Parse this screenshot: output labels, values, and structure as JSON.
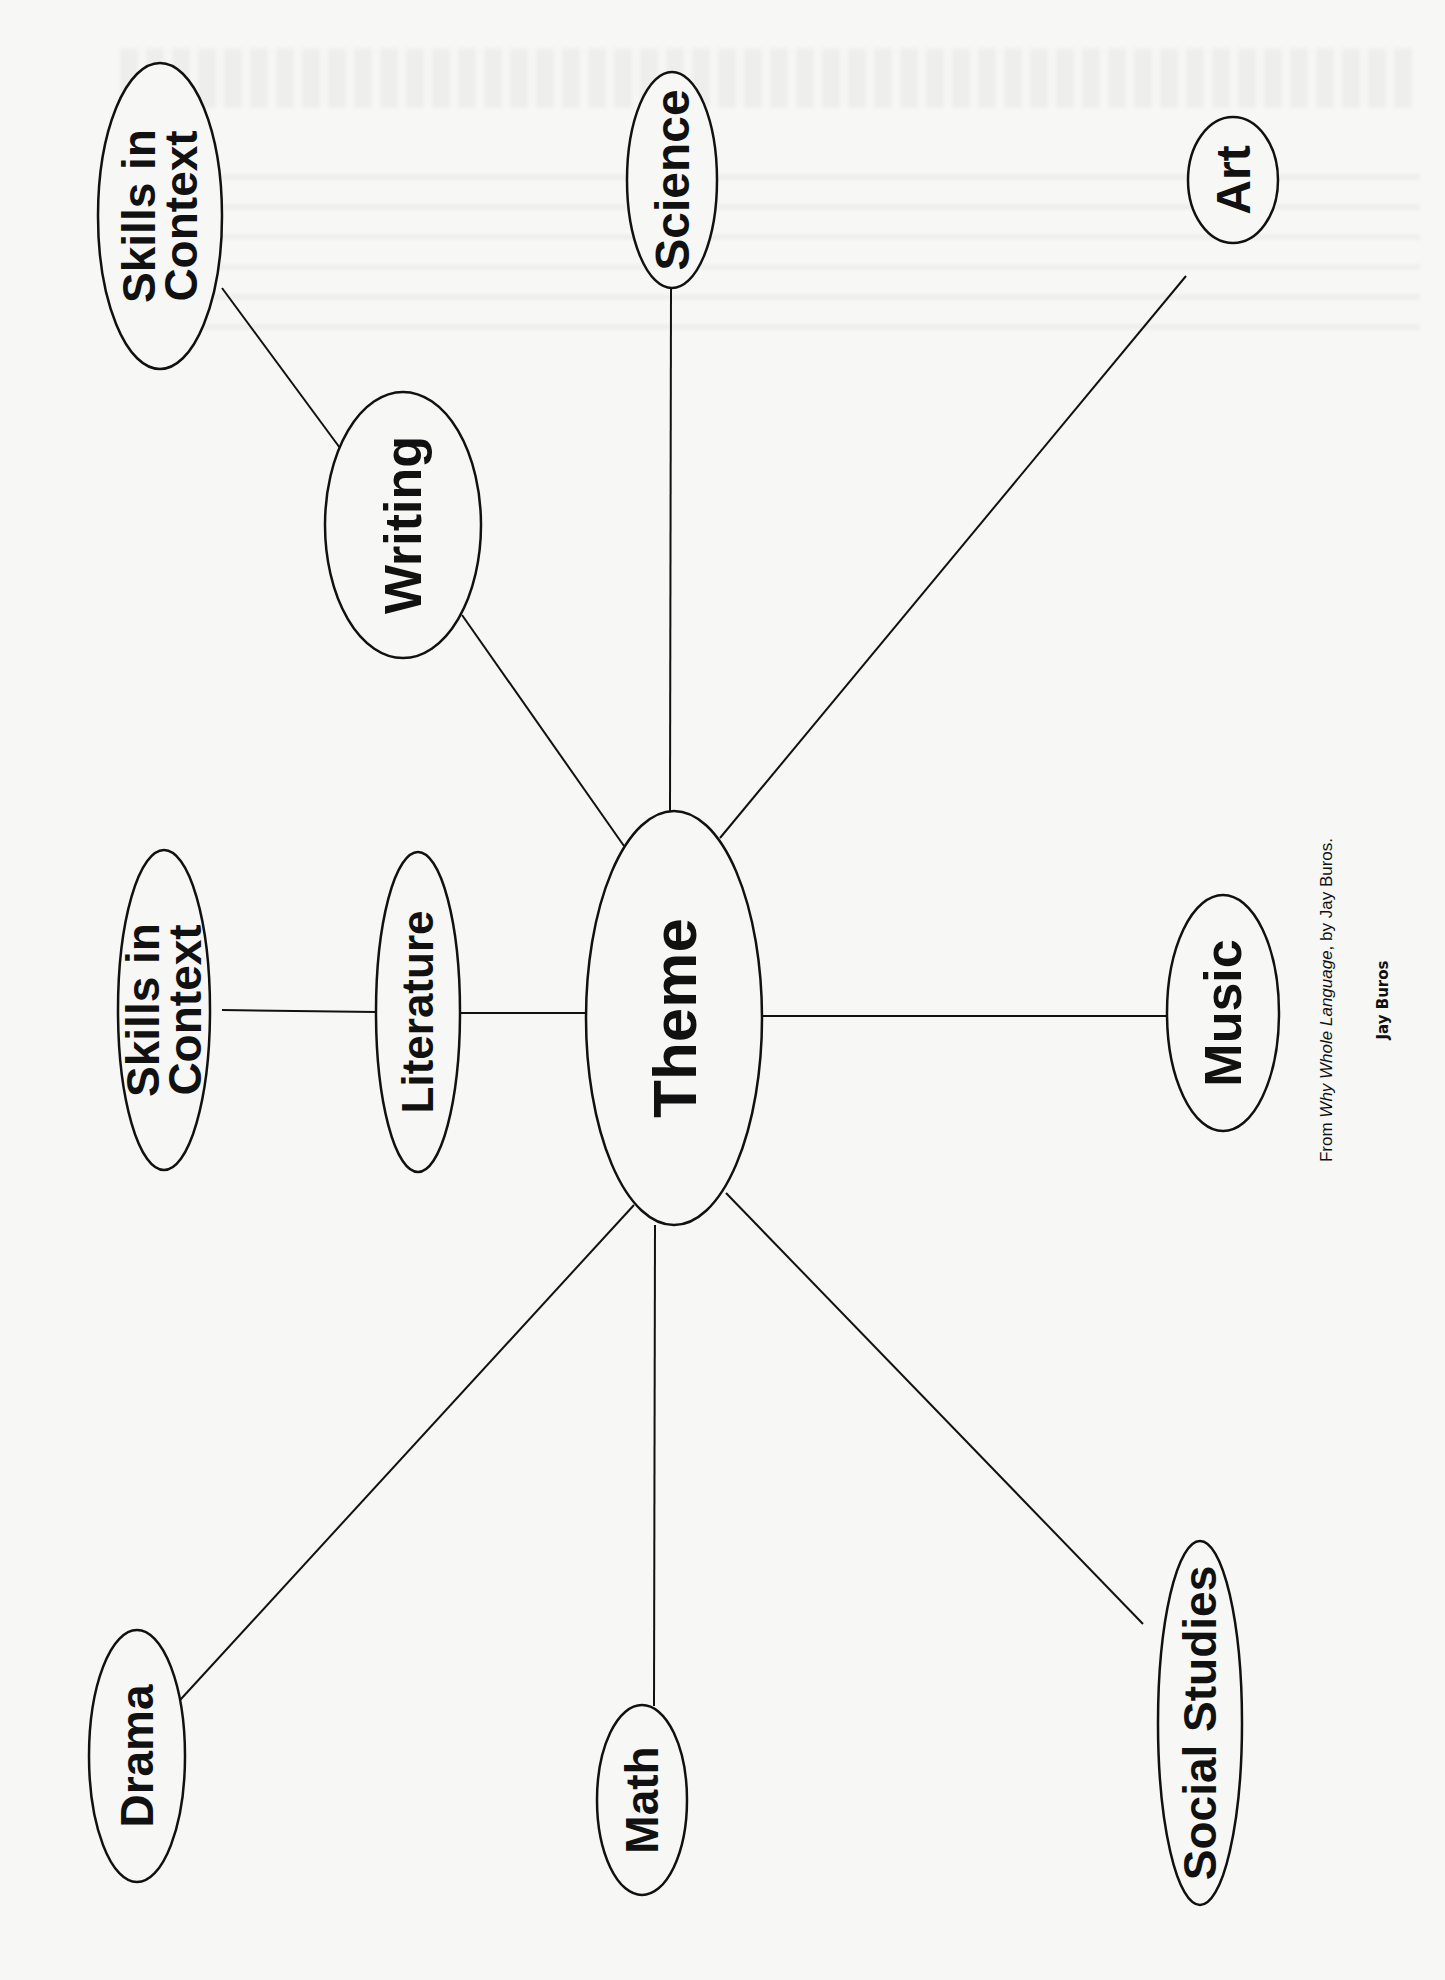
{
  "diagram": {
    "type": "theme web (rotated 90° counter-clockwise)",
    "center": {
      "id": "theme",
      "label": "Theme"
    },
    "nodes": [
      {
        "id": "theme",
        "label": "Theme",
        "lines": [
          "Theme"
        ],
        "cx": 674,
        "cy": 1018,
        "rx": 88,
        "ry": 207,
        "font": 62
      },
      {
        "id": "literature",
        "label": "Literature",
        "lines": [
          "Literature"
        ],
        "cx": 418,
        "cy": 1012,
        "rx": 42,
        "ry": 160,
        "font": 44
      },
      {
        "id": "skills-left",
        "label": "Skills in Context",
        "lines": [
          "Skills in",
          "Context"
        ],
        "cx": 164,
        "cy": 1010,
        "rx": 46,
        "ry": 160,
        "font": 46
      },
      {
        "id": "writing",
        "label": "Writing",
        "lines": [
          "Writing"
        ],
        "cx": 403,
        "cy": 525,
        "rx": 78,
        "ry": 133,
        "font": 52
      },
      {
        "id": "skills-top",
        "label": "Skills in Context",
        "lines": [
          "Skills in",
          "Context"
        ],
        "cx": 160,
        "cy": 216,
        "rx": 62,
        "ry": 153,
        "font": 46
      },
      {
        "id": "science",
        "label": "Science",
        "lines": [
          "Science"
        ],
        "cx": 672,
        "cy": 180,
        "rx": 45,
        "ry": 108,
        "font": 48
      },
      {
        "id": "art",
        "label": "Art",
        "lines": [
          "Art"
        ],
        "cx": 1233,
        "cy": 180,
        "rx": 45,
        "ry": 63,
        "font": 48
      },
      {
        "id": "music",
        "label": "Music",
        "lines": [
          "Music"
        ],
        "cx": 1223,
        "cy": 1013,
        "rx": 56,
        "ry": 118,
        "font": 52
      },
      {
        "id": "social-studies",
        "label": "Social Studies",
        "lines": [
          "Social Studies"
        ],
        "cx": 1200,
        "cy": 1723,
        "rx": 42,
        "ry": 182,
        "font": 46
      },
      {
        "id": "math",
        "label": "Math",
        "lines": [
          "Math"
        ],
        "cx": 642,
        "cy": 1800,
        "rx": 45,
        "ry": 95,
        "font": 46
      },
      {
        "id": "drama",
        "label": "Drama",
        "lines": [
          "Drama"
        ],
        "cx": 137,
        "cy": 1756,
        "rx": 48,
        "ry": 126,
        "font": 46
      }
    ],
    "edges": [
      {
        "from": "theme",
        "to": "literature",
        "x1": 586,
        "y1": 1013,
        "x2": 460,
        "y2": 1013
      },
      {
        "from": "literature",
        "to": "skills-left",
        "x1": 376,
        "y1": 1012,
        "x2": 222,
        "y2": 1010
      },
      {
        "from": "theme",
        "to": "writing",
        "x1": 624,
        "y1": 846,
        "x2": 462,
        "y2": 615
      },
      {
        "from": "writing",
        "to": "skills-top",
        "x1": 340,
        "y1": 448,
        "x2": 222,
        "y2": 288
      },
      {
        "from": "theme",
        "to": "science",
        "x1": 670,
        "y1": 811,
        "x2": 671,
        "y2": 288
      },
      {
        "from": "theme",
        "to": "art",
        "x1": 720,
        "y1": 838,
        "x2": 1186,
        "y2": 276
      },
      {
        "from": "theme",
        "to": "music",
        "x1": 762,
        "y1": 1016,
        "x2": 1167,
        "y2": 1016
      },
      {
        "from": "theme",
        "to": "social-studies",
        "x1": 726,
        "y1": 1193,
        "x2": 1143,
        "y2": 1624
      },
      {
        "from": "theme",
        "to": "math",
        "x1": 655,
        "y1": 1225,
        "x2": 654,
        "y2": 1706
      },
      {
        "from": "theme",
        "to": "drama",
        "x1": 634,
        "y1": 1205,
        "x2": 170,
        "y2": 1711
      }
    ]
  },
  "caption": {
    "prefix": "From ",
    "title": "Why Whole Language",
    "suffix": ", by Jay Buros.",
    "author": "Jay Buros"
  },
  "colors": {
    "paper": "#f7f7f5",
    "ink": "#111111"
  }
}
